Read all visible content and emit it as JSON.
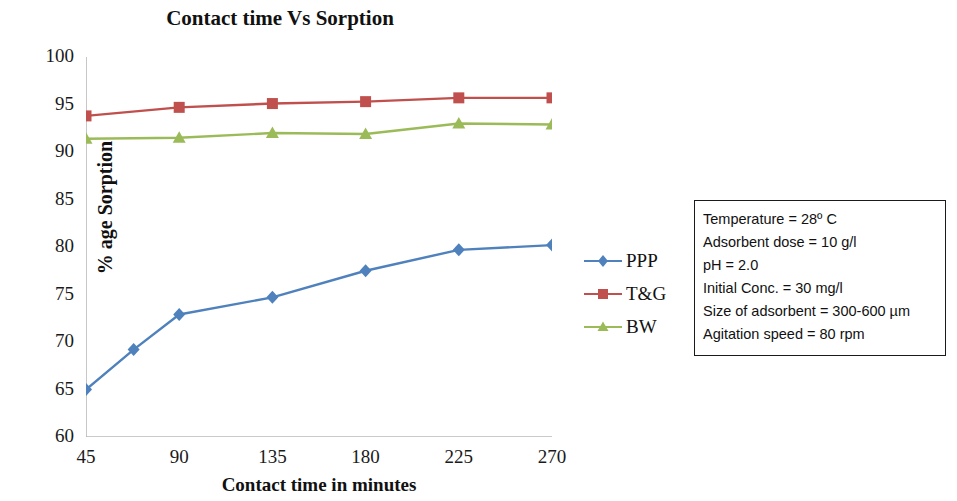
{
  "chart_data": {
    "type": "line",
    "title": "Contact time Vs Sorption",
    "xlabel": "Contact time in  minutes",
    "ylabel": "% age Sorption",
    "xlim": [
      45,
      270
    ],
    "ylim": [
      60,
      100
    ],
    "xticks": [
      45,
      90,
      135,
      180,
      225,
      270
    ],
    "yticks": [
      60,
      65,
      70,
      75,
      80,
      85,
      90,
      95,
      100
    ],
    "grid": false,
    "legend_position": "right",
    "series": [
      {
        "name": "PPP",
        "color": "#4F81BD",
        "marker": "diamond",
        "x": [
          45,
          68,
          90,
          135,
          180,
          225,
          270
        ],
        "values": [
          65.0,
          69.2,
          72.9,
          74.7,
          77.5,
          79.7,
          80.2
        ]
      },
      {
        "name": "T&G",
        "color": "#C0504D",
        "marker": "square",
        "x": [
          45,
          90,
          135,
          180,
          225,
          270
        ],
        "values": [
          93.8,
          94.7,
          95.1,
          95.3,
          95.7,
          95.7
        ]
      },
      {
        "name": "BW",
        "color": "#9BBB59",
        "marker": "triangle",
        "x": [
          45,
          90,
          135,
          180,
          225,
          270
        ],
        "values": [
          91.4,
          91.5,
          92.0,
          91.9,
          93.0,
          92.9
        ]
      }
    ]
  },
  "legend": {
    "items": [
      {
        "label": "PPP",
        "color": "#4F81BD"
      },
      {
        "label": "T&G",
        "color": "#C0504D"
      },
      {
        "label": "BW",
        "color": "#9BBB59"
      }
    ]
  },
  "infobox": {
    "lines": [
      "Temperature = 28º C",
      "Adsorbent dose = 10 g/l",
      "pH = 2.0",
      "Initial Conc. = 30 mg/l",
      "Size of adsorbent = 300-600 µm",
      "Agitation speed = 80 rpm"
    ]
  }
}
